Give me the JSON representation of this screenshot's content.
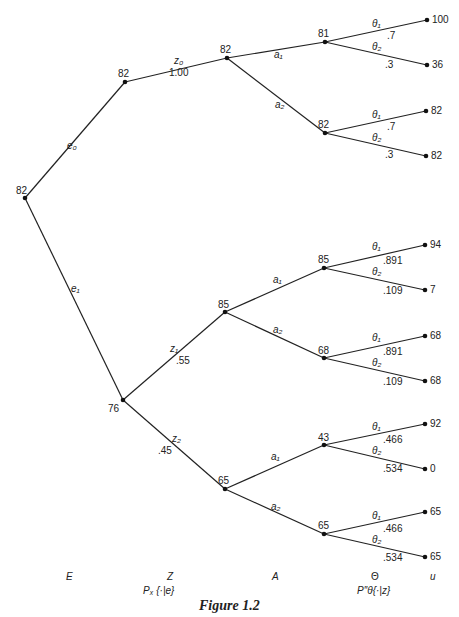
{
  "figure": {
    "caption": "Figure 1.2",
    "stage_labels": {
      "E": "E",
      "Z": "Z",
      "Z_sub": "Pₓ {·|e}",
      "A": "A",
      "Theta": "Θ",
      "Theta_sub": "P″θ{·|z}",
      "u": "u"
    }
  },
  "nodes": {
    "root": "82",
    "e0": "82",
    "e0_z0": "82",
    "e0_z0_a1": "81",
    "e0_z0_a2": "82",
    "e1": "76",
    "e1_z1": "85",
    "e1_z1_a1": "85",
    "e1_z1_a2": "68",
    "e1_z2": "65",
    "e1_z2_a1": "43",
    "e1_z2_a2": "65"
  },
  "edges": {
    "e0": "e₀",
    "e1": "e₁",
    "z0": "z₀",
    "z0_prob": "1.00",
    "z1": "z₁",
    "z1_prob": ".55",
    "z2": "z₂",
    "z2_prob": ".45",
    "a1": "a₁",
    "a2": "a₂",
    "theta1": "θ₁",
    "theta2": "θ₂"
  },
  "leaves": [
    {
      "p1": ".7",
      "p2": ".3",
      "u1": "100",
      "u2": "36"
    },
    {
      "p1": ".7",
      "p2": ".3",
      "u1": "82",
      "u2": "82"
    },
    {
      "p1": ".891",
      "p2": ".109",
      "u1": "94",
      "u2": "7"
    },
    {
      "p1": ".891",
      "p2": ".109",
      "u1": "68",
      "u2": "68"
    },
    {
      "p1": ".466",
      "p2": ".534",
      "u1": "92",
      "u2": "0"
    },
    {
      "p1": ".466",
      "p2": ".534",
      "u1": "65",
      "u2": "65"
    }
  ]
}
